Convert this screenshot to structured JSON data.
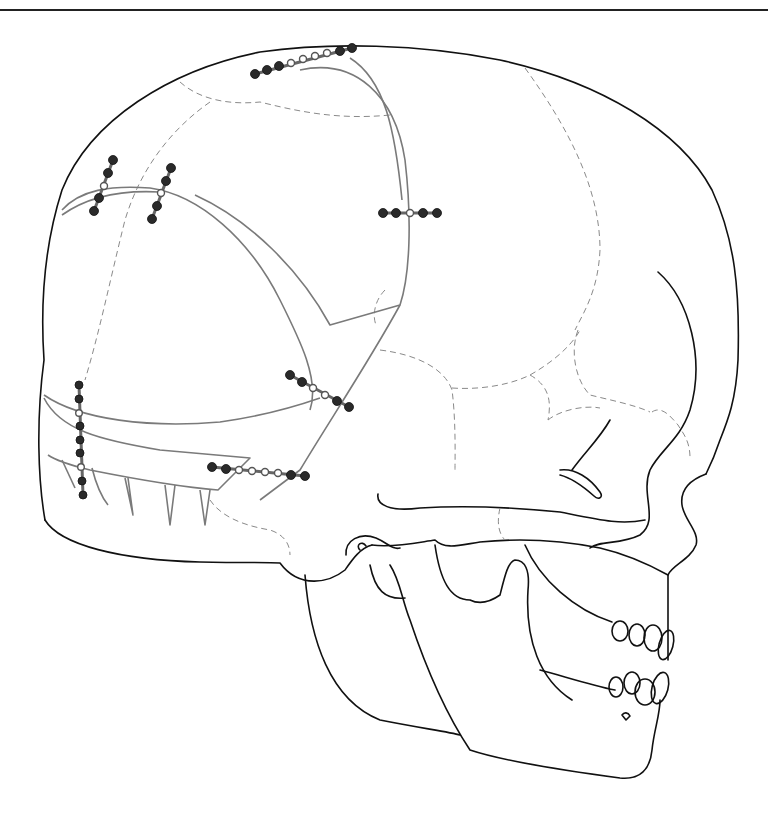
{
  "figure": {
    "header_text_clipped": "",
    "colors": {
      "bone_outline": "#111111",
      "osteotomy_lines": "#7a7a7a",
      "sutures": "#8a8a8a",
      "plate_screw": "#2a2a2a",
      "background": "#ffffff"
    },
    "plates": [
      {
        "id": "vertex-plate",
        "holes": 9,
        "screws": 5
      },
      {
        "id": "frontal-plate-1",
        "holes": 5,
        "screws": 4
      },
      {
        "id": "frontal-plate-2",
        "holes": 5,
        "screws": 4
      },
      {
        "id": "parietal-plate",
        "holes": 5,
        "screws": 4
      },
      {
        "id": "temporal-plate",
        "holes": 6,
        "screws": 4
      },
      {
        "id": "bandeau-vertical-plate",
        "holes": 9,
        "screws": 7
      },
      {
        "id": "bandeau-horizontal-plate",
        "holes": 8,
        "screws": 4
      }
    ]
  }
}
